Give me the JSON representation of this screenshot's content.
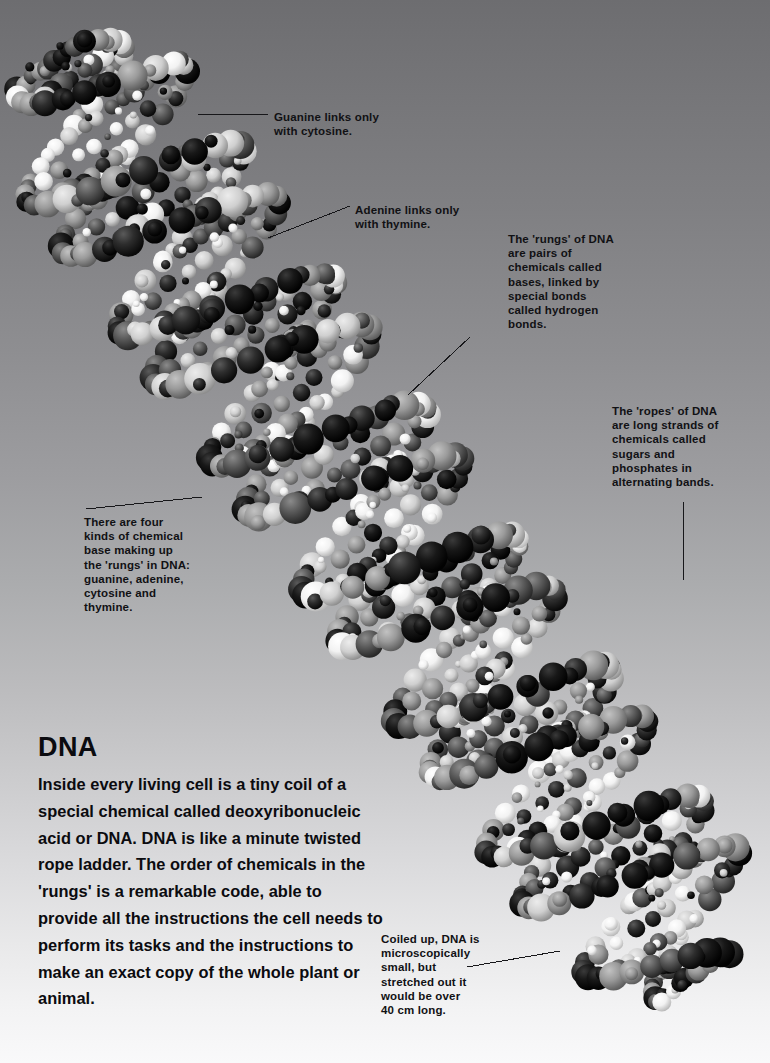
{
  "page": {
    "background_top": "#6d6d70",
    "background_bottom": "#f9f9fa",
    "text_color": "#111114"
  },
  "illustration": {
    "name": "dna-double-helix-space-filling-model",
    "description": "Space-filling molecular model of a DNA double helix running diagonally from upper-left to lower-right",
    "sphere_colors": [
      "#ffffff",
      "#d8d8d8",
      "#a8a8a8",
      "#6a6a6a",
      "#3a3a3a",
      "#141414"
    ]
  },
  "callouts": [
    {
      "id": "guanine",
      "text": "Guanine links only\nwith cytosine.",
      "x": 274,
      "y": 110
    },
    {
      "id": "adenine",
      "text": "Adenine links only\nwith thymine.",
      "x": 355,
      "y": 203
    },
    {
      "id": "rungs",
      "text": "The 'rungs' of DNA\nare pairs of\nchemicals called\nbases, linked by\nspecial bonds\ncalled hydrogen\nbonds.",
      "x": 508,
      "y": 232
    },
    {
      "id": "ropes",
      "text": "The 'ropes' of DNA\nare long strands of\nchemicals called\nsugars and\nphosphates in\nalternating bands.",
      "x": 612,
      "y": 404
    },
    {
      "id": "four-bases",
      "text": "There are four\nkinds of chemical\nbase making up\nthe 'rungs' in DNA:\nguanine, adenine,\ncytosine and\nthymine.",
      "x": 84,
      "y": 515
    },
    {
      "id": "coiled-up",
      "text": "Coiled up, DNA is\nmicroscopically\nsmall, but\nstretched out it\nwould be over\n40 cm long.",
      "x": 381,
      "y": 932
    }
  ],
  "main": {
    "heading": "DNA",
    "body": "Inside every living cell is a tiny coil of a special chemical called deoxyribonucleic acid or DNA. DNA is like a minute twisted rope ladder. The order of chemicals in the 'rungs' is a remarkable code, able to provide all the instructions the cell needs to perform its tasks and the instructions to make an exact copy of the whole plant or animal."
  }
}
